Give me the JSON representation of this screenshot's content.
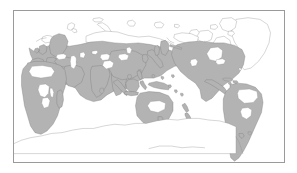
{
  "figure": {
    "type": "distribution-map",
    "projection": "equirectangular-pacific-centered",
    "title": "",
    "caption": "",
    "background_color": "#ffffff",
    "frame": {
      "visible": true,
      "color": "#9a9a9a",
      "line_width_px": 1,
      "left_px": 13,
      "top_px": 10,
      "width_px": 272,
      "height_px": 153
    },
    "labels": [],
    "legend": {
      "visible": false,
      "entries": []
    }
  },
  "map": {
    "shaded_fill_color": "#b3b3b3",
    "unshaded_fill_color": "#ffffff",
    "coastline_color": "#8d8d8d",
    "ocean_color": "#ffffff",
    "lon_range": [
      -60,
      300
    ],
    "lat_range": [
      -90,
      90
    ],
    "regions_shaded": [
      "Africa (sub-Saharan and North Africa coastal)",
      "Madagascar",
      "Europe (central and southern)",
      "Middle East and Arabian Peninsula",
      "Central Asia",
      "Siberia (southern and central)",
      "India and South Asia",
      "China and East Asia",
      "Japan",
      "Southeast Asia and Indonesia",
      "New Guinea",
      "Australia (coastal)",
      "New Zealand",
      "North America (conterminous and southern Canada)",
      "Mexico and Central America",
      "Caribbean",
      "South America (Andes, eastern Brazil, southern cone)"
    ],
    "regions_unshaded": [
      "Greenland",
      "Canadian Arctic Archipelago",
      "Svalbard",
      "Iceland",
      "Novaya Zemlya",
      "Arctic northern Siberia",
      "Sahara interior",
      "Congo basin interior",
      "Australian interior",
      "Amazon basin interior",
      "Antarctica"
    ]
  }
}
